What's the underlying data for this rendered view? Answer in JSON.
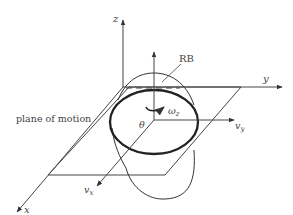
{
  "figure": {
    "width": 293,
    "height": 215,
    "background": "#ffffff",
    "stroke_color": "#333333",
    "labels": {
      "z_axis": "z",
      "y_axis": "y",
      "x_axis": "x",
      "rb": "RB",
      "plane": "plane of motion",
      "omega": "ω",
      "omega_sub": "z",
      "theta": "θ",
      "vy": "v",
      "vy_sub": "y",
      "vx": "v",
      "vx_sub": "x"
    }
  },
  "elements": [
    "global z-axis",
    "global y-axis",
    "global x-axis",
    "plane of motion (parallelogram)",
    "robot body RB (ellipsoid)",
    "body vertical axis",
    "body velocity axis v_y",
    "body velocity axis v_x",
    "rotation arrow omega_z",
    "heading angle theta"
  ]
}
